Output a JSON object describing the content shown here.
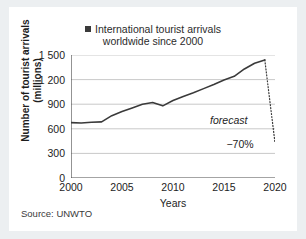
{
  "card": {
    "source_note": "Source: UNWTO"
  },
  "legend": {
    "marker": "square-marker",
    "line1": "International tourist arrivals",
    "line2": "worldwide since 2000"
  },
  "axes": {
    "ytitle_line1": "Number of tourist arrivals",
    "ytitle_line2": "(millions)",
    "xtitle": "Years"
  },
  "annotations": {
    "forecast": "forecast",
    "drop": "−70%"
  },
  "colors": {
    "line": "#3a3a3a",
    "grid": "#c9c9c9",
    "axis": "#4a4a4a",
    "text": "#1d1d1d",
    "card_bg": "#ffffff",
    "page_bg": "#eceff1"
  },
  "chart_data": {
    "type": "line",
    "title": "International tourist arrivals worldwide since 2000",
    "xlabel": "Years",
    "ylabel": "Number of tourist arrivals (millions)",
    "xlim": [
      2000,
      2020
    ],
    "ylim": [
      0,
      1500
    ],
    "yticks": [
      0,
      300,
      600,
      900,
      1200,
      1500
    ],
    "ytick_labels": [
      "0",
      "300",
      "600",
      "900",
      "1 200",
      "1 500"
    ],
    "xticks": [
      2000,
      2005,
      2010,
      2015,
      2020
    ],
    "xtick_labels": [
      "2000",
      "2005",
      "2010",
      "2015",
      "2020"
    ],
    "grid": "horizontal",
    "legend_position": "top-center",
    "series": [
      {
        "name": "International tourist arrivals",
        "style": "solid",
        "x": [
          2000,
          2001,
          2002,
          2003,
          2004,
          2005,
          2006,
          2007,
          2008,
          2009,
          2010,
          2011,
          2012,
          2013,
          2014,
          2015,
          2016,
          2017,
          2018,
          2019
        ],
        "values": [
          675,
          670,
          680,
          685,
          760,
          810,
          855,
          900,
          920,
          880,
          945,
          995,
          1040,
          1090,
          1140,
          1195,
          1240,
          1330,
          1400,
          1440
        ]
      },
      {
        "name": "forecast",
        "style": "dotted",
        "x": [
          2019,
          2020
        ],
        "values": [
          1440,
          430
        ]
      }
    ],
    "annotations": [
      {
        "text": "forecast",
        "x": 2017.3,
        "y": 700,
        "style": "italic"
      },
      {
        "text": "−70%",
        "x": 2017.9,
        "y": 400,
        "style": "normal"
      }
    ]
  }
}
